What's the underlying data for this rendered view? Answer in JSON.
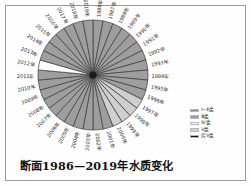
{
  "chart_data": {
    "type": "pie",
    "title": "断面1986—2019年水质变化",
    "xlabel": "",
    "ylabel": "",
    "legend_position": "right",
    "grid": false,
    "note": "每年一个等角扇区，共34个扇区，按水质类别着色",
    "categories": [
      "1986年",
      "1987年",
      "1988年",
      "1989年",
      "1990年",
      "1991年",
      "1992年",
      "1993年",
      "1994年",
      "1995年",
      "1996年",
      "1997年",
      "1998年",
      "1999年",
      "2000年",
      "2001年",
      "2002年",
      "2003年",
      "2004年",
      "2005年",
      "2006年",
      "2007年",
      "2008年",
      "2009年",
      "2010年",
      "2011年",
      "2012年",
      "2013年",
      "2014年",
      "2015年",
      "2016年",
      "2017年",
      "2018年",
      "2019年"
    ],
    "values": [
      1,
      1,
      1,
      1,
      1,
      1,
      1,
      1,
      1,
      1,
      1,
      1,
      1,
      1,
      1,
      1,
      1,
      1,
      1,
      1,
      1,
      1,
      1,
      1,
      1,
      1,
      1,
      1,
      1,
      1,
      1,
      1,
      1,
      1
    ],
    "classes": [
      "Ⅲ类",
      "Ⅲ类",
      "Ⅲ类",
      "Ⅲ类",
      "Ⅲ类",
      "Ⅲ类",
      "Ⅲ类",
      "Ⅲ类",
      "Ⅲ类",
      "Ⅲ类",
      "Ⅲ类",
      "Ⅴ类",
      "Ⅴ类",
      "Ⅴ类",
      "Ⅴ类",
      "Ⅲ类",
      "Ⅲ类",
      "Ⅲ类",
      "Ⅲ类",
      "Ⅲ类",
      "Ⅲ类",
      "Ⅲ类",
      "Ⅲ类",
      "Ⅲ类",
      "Ⅲ类",
      "Ⅲ类",
      "Ⅳ类",
      "Ⅲ类",
      "Ⅲ类",
      "Ⅲ类",
      "Ⅲ类",
      "Ⅲ类",
      "Ⅲ类",
      "Ⅲ类"
    ],
    "class_colors": {
      "Ⅰ~Ⅱ类": "#8c8c8c",
      "Ⅲ类": "#9e9e9e",
      "Ⅳ类": "#fbfbfb",
      "Ⅴ类": "#cfcfcf",
      "劣Ⅴ类": "#111111"
    }
  },
  "legend": {
    "items": [
      {
        "label": "Ⅰ~Ⅱ类",
        "color": "#8c8c8c"
      },
      {
        "label": "Ⅲ类",
        "color": "#9e9e9e"
      },
      {
        "label": "Ⅳ类",
        "color": "#fbfbfb"
      },
      {
        "label": "Ⅴ类",
        "color": "#cfcfcf"
      },
      {
        "label": "劣Ⅴ类",
        "color": "#111111"
      }
    ]
  },
  "title": {
    "text": "断面1986—2019年水质变化"
  }
}
